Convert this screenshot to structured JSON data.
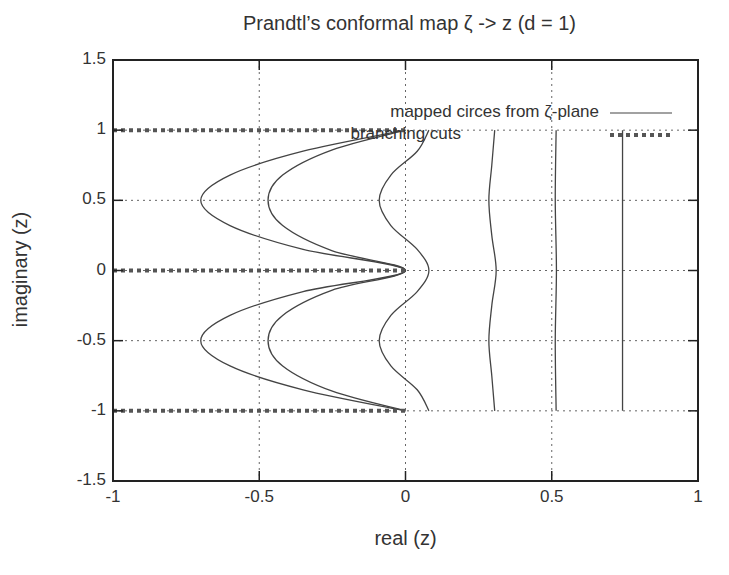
{
  "chart_data": {
    "type": "line",
    "title": "Prandtl’s conformal map ζ  ->  z (d = 1)",
    "xlabel": "real (z)",
    "ylabel": "imaginary (z)",
    "xlim": [
      -1,
      1
    ],
    "ylim": [
      -1.5,
      1.5
    ],
    "xticks": [
      "-1",
      "-0.5",
      "0",
      "0.5",
      "1"
    ],
    "yticks": [
      "1.5",
      "1",
      "0.5",
      "0",
      "-0.5",
      "-1",
      "-1.5"
    ],
    "grid": true,
    "legend_position": "top-right",
    "legend": [
      {
        "label": "mapped circes from ζ-plane",
        "style": "solid"
      },
      {
        "label": "branching cuts",
        "style": "dotted-thick"
      }
    ],
    "series": [
      {
        "name": "mapped circle 1",
        "style": "solid",
        "points": [
          [
            0,
            -1
          ],
          [
            -0.35,
            -0.85
          ],
          [
            -0.6,
            -0.68
          ],
          [
            -0.7,
            -0.5
          ],
          [
            -0.6,
            -0.32
          ],
          [
            -0.35,
            -0.15
          ],
          [
            0,
            0
          ],
          [
            -0.35,
            0.15
          ],
          [
            -0.6,
            0.32
          ],
          [
            -0.7,
            0.5
          ],
          [
            -0.6,
            0.68
          ],
          [
            -0.35,
            0.85
          ],
          [
            0,
            1
          ]
        ]
      },
      {
        "name": "mapped circle 2",
        "style": "solid",
        "points": [
          [
            0,
            -1
          ],
          [
            -0.25,
            -0.86
          ],
          [
            -0.42,
            -0.68
          ],
          [
            -0.47,
            -0.5
          ],
          [
            -0.42,
            -0.32
          ],
          [
            -0.25,
            -0.14
          ],
          [
            0,
            0
          ],
          [
            -0.25,
            0.14
          ],
          [
            -0.42,
            0.32
          ],
          [
            -0.47,
            0.5
          ],
          [
            -0.42,
            0.68
          ],
          [
            -0.25,
            0.86
          ],
          [
            0,
            1
          ]
        ]
      },
      {
        "name": "mapped circle 3",
        "style": "solid",
        "points": [
          [
            0.08,
            -1
          ],
          [
            0.04,
            -0.85
          ],
          [
            -0.05,
            -0.68
          ],
          [
            -0.09,
            -0.5
          ],
          [
            -0.05,
            -0.32
          ],
          [
            0.04,
            -0.15
          ],
          [
            0.08,
            0
          ],
          [
            0.04,
            0.15
          ],
          [
            -0.05,
            0.32
          ],
          [
            -0.09,
            0.5
          ],
          [
            -0.05,
            0.68
          ],
          [
            0.04,
            0.85
          ],
          [
            0.08,
            1
          ]
        ]
      },
      {
        "name": "mapped circle 4",
        "style": "solid",
        "points": [
          [
            0.305,
            -1
          ],
          [
            0.295,
            -0.75
          ],
          [
            0.285,
            -0.5
          ],
          [
            0.295,
            -0.25
          ],
          [
            0.31,
            0
          ],
          [
            0.295,
            0.25
          ],
          [
            0.285,
            0.5
          ],
          [
            0.295,
            0.75
          ],
          [
            0.305,
            1
          ]
        ]
      },
      {
        "name": "mapped circle 5",
        "style": "solid",
        "points": [
          [
            0.515,
            -1
          ],
          [
            0.512,
            -0.5
          ],
          [
            0.516,
            0
          ],
          [
            0.512,
            0.5
          ],
          [
            0.515,
            1
          ]
        ]
      },
      {
        "name": "mapped circle 6",
        "style": "solid",
        "points": [
          [
            0.742,
            -1
          ],
          [
            0.742,
            1
          ]
        ]
      },
      {
        "name": "branching cut y=1",
        "style": "dotted-thick",
        "points": [
          [
            -1,
            1
          ],
          [
            0,
            1
          ]
        ]
      },
      {
        "name": "branching cut y=0",
        "style": "dotted-thick",
        "points": [
          [
            -1,
            0
          ],
          [
            0,
            0
          ]
        ]
      },
      {
        "name": "branching cut y=-1",
        "style": "dotted-thick",
        "points": [
          [
            -1,
            -1
          ],
          [
            0,
            -1
          ]
        ]
      }
    ]
  }
}
